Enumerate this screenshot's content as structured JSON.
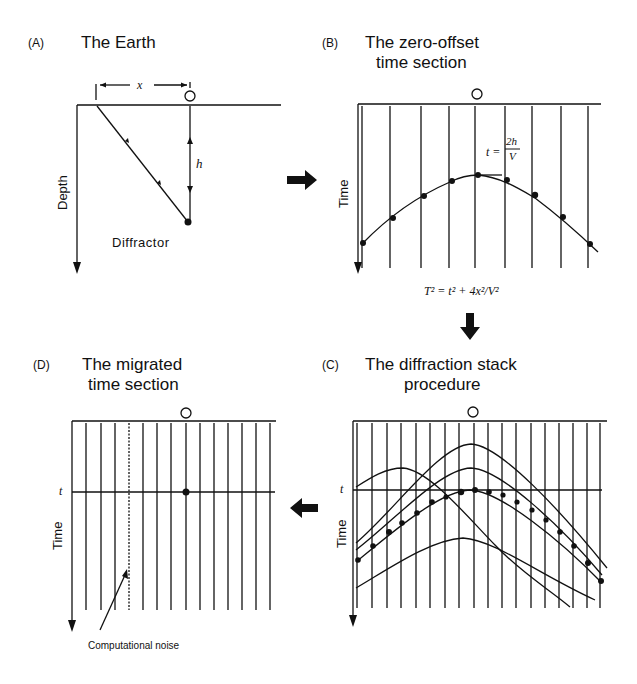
{
  "figure": {
    "panels": [
      {
        "id": "A",
        "label": "(A)",
        "title_lines": [
          "The Earth"
        ],
        "axis_label": "Depth",
        "annotations": {
          "offset": "x",
          "depth": "h",
          "point": "Diffractor"
        }
      },
      {
        "id": "B",
        "label": "(B)",
        "title_lines": [
          "The zero-offset",
          "time section"
        ],
        "axis_label": "Time",
        "annotations": {
          "apex_eq_lhs": "t =",
          "apex_eq_num": "2h",
          "apex_eq_den": "V"
        }
      },
      {
        "id": "C",
        "label": "(C)",
        "title_lines": [
          "The diffraction stack",
          "procedure"
        ],
        "axis_label": "Time",
        "annotations": {
          "time_marker": "t"
        }
      },
      {
        "id": "D",
        "label": "(D)",
        "title_lines": [
          "The migrated",
          "time section"
        ],
        "axis_label": "Time",
        "annotations": {
          "time_marker": "t",
          "noise_label": "Computational noise"
        }
      }
    ],
    "transition_formula": "T² = t² + 4x²/V²",
    "arrows": [
      {
        "from": "A",
        "to": "B",
        "direction": "right"
      },
      {
        "from": "B",
        "to": "C",
        "direction": "down"
      },
      {
        "from": "C",
        "to": "D",
        "direction": "left"
      }
    ]
  }
}
